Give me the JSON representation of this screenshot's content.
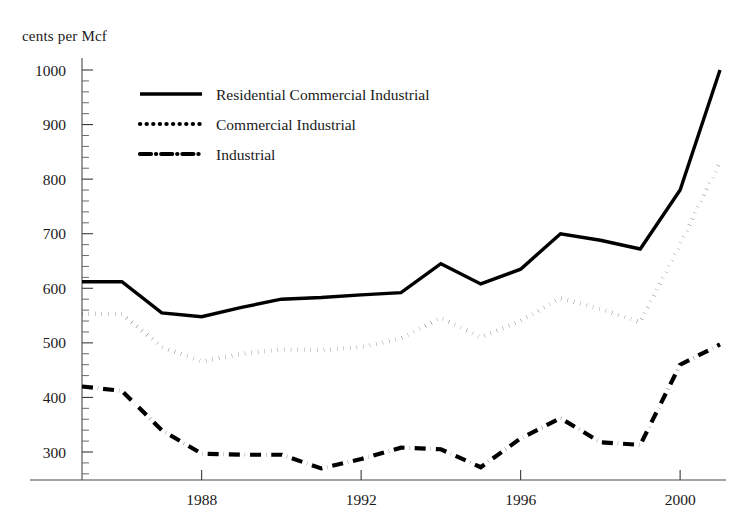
{
  "figure": {
    "y_axis_caption": "cents per Mcf"
  },
  "legend": {
    "items": [
      {
        "label": "Residential Commercial Industrial",
        "style": "solid"
      },
      {
        "label": "Commercial Industrial",
        "style": "dotted"
      },
      {
        "label": "Industrial",
        "style": "dash-dot"
      }
    ]
  },
  "chart_data": {
    "type": "line",
    "title": "",
    "xlabel": "",
    "ylabel": "cents per Mcf",
    "xlim": [
      1985,
      2001
    ],
    "ylim": [
      255,
      1015
    ],
    "grid": false,
    "legend_position": "top-left-inside",
    "y_ticks": [
      300,
      400,
      500,
      600,
      700,
      800,
      900,
      1000
    ],
    "y_minor_tick_step": 20,
    "x_ticks": [
      1988,
      1992,
      1996,
      2000
    ],
    "x_tick_labels": [
      "1988",
      "1992",
      "1996",
      "2000"
    ],
    "x": [
      1985,
      1986,
      1987,
      1988,
      1989,
      1990,
      1991,
      1992,
      1993,
      1994,
      1995,
      1996,
      1997,
      1998,
      1999,
      2000,
      2001
    ],
    "series": [
      {
        "name": "Residential Commercial Industrial",
        "style": "solid",
        "values": [
          612,
          612,
          555,
          548,
          565,
          580,
          583,
          588,
          592,
          645,
          608,
          635,
          700,
          688,
          672,
          780,
          1000
        ]
      },
      {
        "name": "Commercial Industrial",
        "style": "dotted",
        "values": [
          553,
          553,
          492,
          466,
          480,
          488,
          487,
          492,
          508,
          546,
          510,
          540,
          582,
          562,
          538,
          680,
          832
        ]
      },
      {
        "name": "Industrial",
        "style": "dash-dot",
        "values": [
          420,
          412,
          340,
          297,
          295,
          295,
          270,
          287,
          308,
          305,
          272,
          325,
          362,
          318,
          313,
          460,
          497
        ]
      }
    ]
  }
}
